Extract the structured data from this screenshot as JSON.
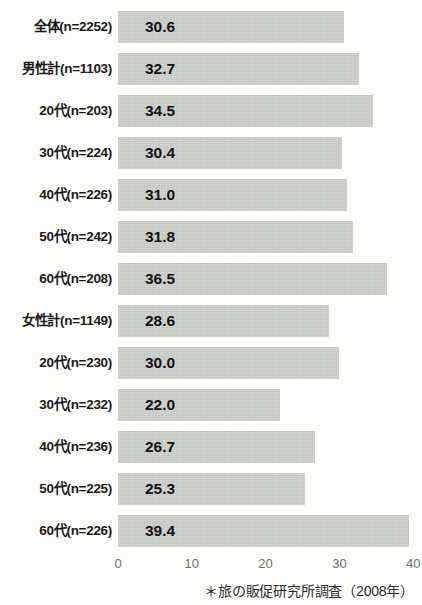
{
  "chart_data": {
    "type": "bar",
    "orientation": "horizontal",
    "title": "",
    "xlabel": "",
    "ylabel": "",
    "xlim": [
      0,
      40
    ],
    "xticks": [
      "0",
      "10",
      "20",
      "30",
      "40"
    ],
    "grid": false,
    "legend": null,
    "categories": [
      "全体(n=2252)",
      "男性計(n=1103)",
      "20代(n=203)",
      "30代(n=224)",
      "40代(n=226)",
      "50代(n=242)",
      "60代(n=208)",
      "女性計(n=1149)",
      "20代(n=230)",
      "30代(n=232)",
      "40代(n=236)",
      "50代(n=225)",
      "60代(n=226)"
    ],
    "values": [
      30.6,
      32.7,
      34.5,
      30.4,
      31.0,
      31.8,
      36.5,
      28.6,
      30.0,
      22.0,
      26.7,
      25.3,
      39.4
    ],
    "value_labels": [
      "30.6",
      "32.7",
      "34.5",
      "30.4",
      "31.0",
      "31.8",
      "36.5",
      "28.6",
      "30.0",
      "22.0",
      "26.7",
      "25.3",
      "39.4"
    ],
    "annotation": "＊旅の販促研究所調査（2008年）",
    "bar_color": "#c4c8c1",
    "text_color": "#111111",
    "tick_color": "#6d6d6d",
    "background_color": "#fdfdfb"
  }
}
